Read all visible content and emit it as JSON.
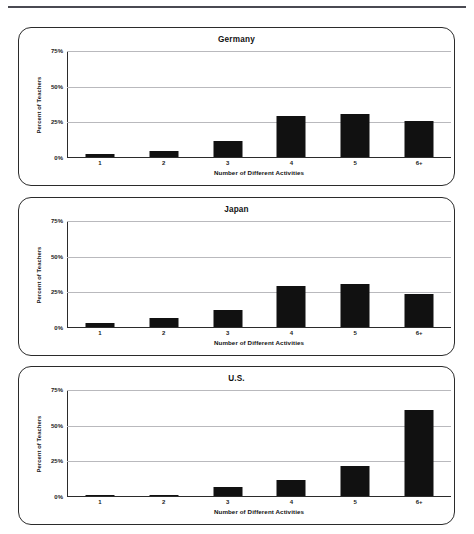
{
  "page": {
    "top_rule": true
  },
  "axis": {
    "y_title": "Percent of Teachers",
    "x_title": "Number of Different Activities",
    "y_ticks": [
      "0%",
      "25%",
      "50%",
      "75%"
    ],
    "y_tick_75": "75%",
    "y_tick_50": "50%",
    "y_tick_25": "25%",
    "y_tick_0": "0%"
  },
  "charts": [
    {
      "title": "Germany",
      "categories": [
        "1",
        "2",
        "3",
        "4",
        "5",
        "6+"
      ],
      "values": [
        2,
        4,
        11,
        29,
        30,
        25
      ]
    },
    {
      "title": "Japan",
      "categories": [
        "1",
        "2",
        "3",
        "4",
        "5",
        "6+"
      ],
      "values": [
        3,
        6,
        12,
        29,
        30,
        23
      ]
    },
    {
      "title": "U.S.",
      "categories": [
        "1",
        "2",
        "3",
        "4",
        "5",
        "6+"
      ],
      "values": [
        1,
        1,
        6,
        11,
        21,
        60
      ]
    }
  ],
  "chart_data": [
    {
      "type": "bar",
      "title": "Germany",
      "categories": [
        "1",
        "2",
        "3",
        "4",
        "5",
        "6+"
      ],
      "values": [
        2,
        4,
        11,
        29,
        30,
        25
      ],
      "xlabel": "Number of Different Activities",
      "ylabel": "Percent of Teachers",
      "ylim": [
        0,
        75
      ],
      "yticks": [
        0,
        25,
        50,
        75
      ],
      "ytick_labels": [
        "0%",
        "25%",
        "50%",
        "75%"
      ],
      "grid": true,
      "legend": false,
      "bar_color": "#111111"
    },
    {
      "type": "bar",
      "title": "Japan",
      "categories": [
        "1",
        "2",
        "3",
        "4",
        "5",
        "6+"
      ],
      "values": [
        3,
        6,
        12,
        29,
        30,
        23
      ],
      "xlabel": "Number of Different Activities",
      "ylabel": "Percent of Teachers",
      "ylim": [
        0,
        75
      ],
      "yticks": [
        0,
        25,
        50,
        75
      ],
      "ytick_labels": [
        "0%",
        "25%",
        "50%",
        "75%"
      ],
      "grid": true,
      "legend": false,
      "bar_color": "#111111"
    },
    {
      "type": "bar",
      "title": "U.S.",
      "categories": [
        "1",
        "2",
        "3",
        "4",
        "5",
        "6+"
      ],
      "values": [
        1,
        1,
        6,
        11,
        21,
        60
      ],
      "xlabel": "Number of Different Activities",
      "ylabel": "Percent of Teachers",
      "ylim": [
        0,
        75
      ],
      "yticks": [
        0,
        25,
        50,
        75
      ],
      "ytick_labels": [
        "0%",
        "25%",
        "50%",
        "75%"
      ],
      "grid": true,
      "legend": false,
      "bar_color": "#111111"
    }
  ]
}
